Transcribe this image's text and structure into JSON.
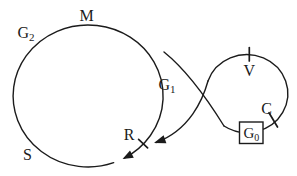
{
  "colors": {
    "ink": "#1b1b1b",
    "background": "#ffffff",
    "box_fill": "#ffffff"
  },
  "main_cycle": {
    "phase_m": "M",
    "phase_g2": {
      "base": "G",
      "sub": "2"
    },
    "phase_g1": {
      "base": "G",
      "sub": "1"
    },
    "phase_s": "S",
    "restriction_point": "R"
  },
  "g0_loop": {
    "checkpoint_v": "V",
    "checkpoint_c": "C",
    "state_g0": {
      "base": "G",
      "sub": "0"
    }
  }
}
